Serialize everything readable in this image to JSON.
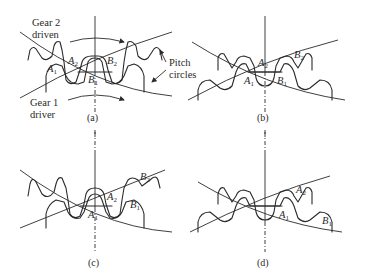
{
  "figure": {
    "panels": [
      {
        "id": "a",
        "caption": "(a)",
        "labels": {
          "gear2": [
            "Gear 2",
            "driven"
          ],
          "gear1": [
            "Gear 1",
            "driver"
          ],
          "pitch": [
            "Pitch",
            "circles"
          ],
          "points": [
            {
              "letter": "A",
              "sub": "1"
            },
            {
              "letter": "A",
              "sub": "2"
            },
            {
              "letter": "B",
              "sub": "1"
            },
            {
              "letter": "B",
              "sub": "2"
            }
          ]
        }
      },
      {
        "id": "b",
        "caption": "(b)",
        "labels": {
          "points": [
            {
              "letter": "A",
              "sub": "2"
            },
            {
              "letter": "B",
              "sub": "2"
            },
            {
              "letter": "A",
              "sub": "1"
            },
            {
              "letter": "B",
              "sub": "1"
            }
          ]
        }
      },
      {
        "id": "c",
        "caption": "(c)",
        "labels": {
          "points": [
            {
              "letter": "B",
              "sub": "2"
            },
            {
              "letter": "A",
              "sub": "2"
            },
            {
              "letter": "B",
              "sub": "1"
            },
            {
              "letter": "A",
              "sub": "1"
            }
          ]
        }
      },
      {
        "id": "d",
        "caption": "(d)",
        "labels": {
          "points": [
            {
              "letter": "A",
              "sub": "2"
            },
            {
              "letter": "A",
              "sub": "1"
            },
            {
              "letter": "B",
              "sub": "1"
            }
          ]
        }
      }
    ]
  }
}
